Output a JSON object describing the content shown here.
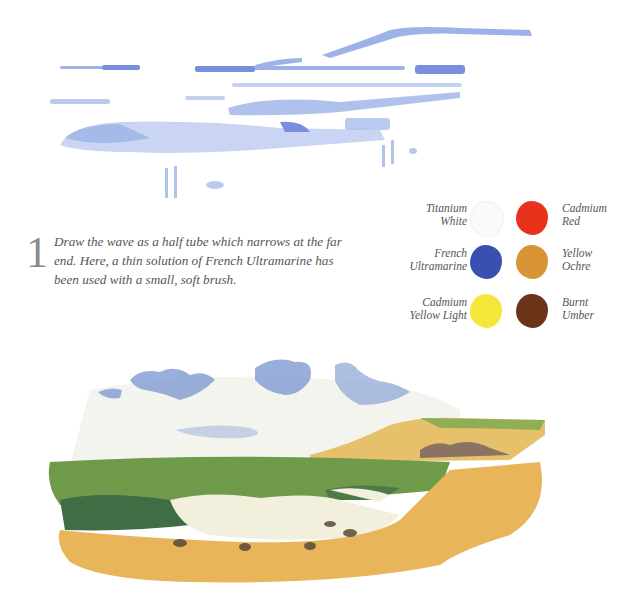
{
  "caption": {
    "step_number": "1",
    "text": "Draw the wave as a half tube which narrows at the far end. Here, a thin solution of French Ultramarine has been used with a small, soft brush."
  },
  "palette": {
    "colors": [
      {
        "name": "Titanium White",
        "line1": "Titanium",
        "line2": "White",
        "hex": "#f7f7f5"
      },
      {
        "name": "Cadmium Red",
        "line1": "Cadmium",
        "line2": "Red",
        "hex": "#e8321c"
      },
      {
        "name": "French Ultramarine",
        "line1": "French",
        "line2": "Ultramarine",
        "hex": "#3a4fb0"
      },
      {
        "name": "Yellow Ochre",
        "line1": "Yellow",
        "line2": "Ochre",
        "hex": "#d99535"
      },
      {
        "name": "Cadmium Yellow Light",
        "line1": "Cadmium",
        "line2": "Yellow Light",
        "hex": "#f5e63a"
      },
      {
        "name": "Burnt Umber",
        "line1": "Burnt",
        "line2": "Umber",
        "hex": "#6b3418"
      }
    ]
  },
  "illustrations": {
    "sketch": "Blue ultramarine underdrawing of a wave as a half tube",
    "painting": "Finished seascape: clouds, green sea, breaking wave, sandy beach and cliff"
  },
  "colors": {
    "sketch_blue": "#6f8fd6",
    "sea_green": "#6f9a4a",
    "sand": "#e8b55a",
    "sky_cloud": "#8ea6d6"
  }
}
